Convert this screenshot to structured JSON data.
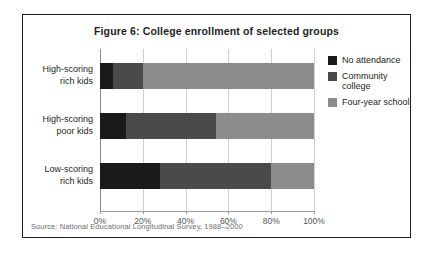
{
  "figure": {
    "title": "Figure 6: College enrollment of selected groups",
    "source": "Source: National Educational Longitudinal Survey, 1988–2000"
  },
  "legend": {
    "position": "right",
    "items": [
      {
        "label": "No attendance",
        "color": "#1a1a1a",
        "icon": "legend-swatch-icon"
      },
      {
        "label": "Community college",
        "color": "#4a4a4a",
        "icon": "legend-swatch-icon"
      },
      {
        "label": "Four-year school",
        "color": "#8c8c8c",
        "icon": "legend-swatch-icon"
      }
    ]
  },
  "axis": {
    "ticks": [
      {
        "label": "0%",
        "value": 0
      },
      {
        "label": "20%",
        "value": 20
      },
      {
        "label": "40%",
        "value": 40
      },
      {
        "label": "60%",
        "value": 60
      },
      {
        "label": "80%",
        "value": 80
      },
      {
        "label": "100%",
        "value": 100
      }
    ]
  },
  "categories_display": [
    {
      "line1": "High-scoring",
      "line2": "rich kids"
    },
    {
      "line1": "High-scoring",
      "line2": "poor kids"
    },
    {
      "line1": "Low-scoring",
      "line2": "rich kids"
    }
  ],
  "chart_data": {
    "type": "bar",
    "orientation": "horizontal",
    "stacked": true,
    "title": "Figure 6: College enrollment of selected groups",
    "xlabel": "",
    "ylabel": "",
    "xlim": [
      0,
      100
    ],
    "grid": true,
    "legend_position": "right",
    "categories": [
      "High-scoring rich kids",
      "High-scoring poor kids",
      "Low-scoring rich kids"
    ],
    "series": [
      {
        "name": "No attendance",
        "color": "#1a1a1a",
        "values": [
          6,
          12,
          28
        ]
      },
      {
        "name": "Community college",
        "color": "#4a4a4a",
        "values": [
          14,
          42,
          52
        ]
      },
      {
        "name": "Four-year school",
        "color": "#8c8c8c",
        "values": [
          80,
          46,
          20
        ]
      }
    ],
    "annotations": [
      "Source: National Educational Longitudinal Survey, 1988–2000"
    ]
  }
}
